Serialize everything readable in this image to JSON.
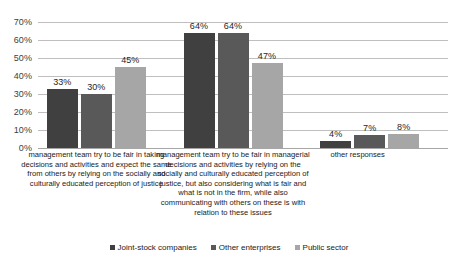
{
  "chart_data": {
    "type": "bar",
    "title": "",
    "xlabel": "",
    "ylabel": "",
    "ylim": [
      0,
      70
    ],
    "grid": true,
    "legend_position": "bottom",
    "categories": [
      "management team try to be fair in taking decisions and activities and expect the same from others by relying on the socially and culturally educated perception of justice",
      "management team try to be fair in managerial decisions and activities by relying on the socially and culturally educated perception of justice, but also considering what is fair and what is not in the firm, while also communicating with others on these is with relation to these issues",
      "other responses"
    ],
    "series": [
      {
        "name": "Joint-stock companies",
        "color": "#404040",
        "values": [
          33,
          64,
          4
        ]
      },
      {
        "name": "Other enterprises",
        "color": "#595959",
        "values": [
          30,
          64,
          7
        ]
      },
      {
        "name": "Public sector",
        "color": "#a6a6a6",
        "values": [
          45,
          47,
          8
        ]
      }
    ],
    "y_ticks": [
      "0%",
      "10%",
      "20%",
      "30%",
      "40%",
      "50%",
      "60%",
      "70%"
    ],
    "data_labels": [
      [
        "33%",
        "30%",
        "45%"
      ],
      [
        "64%",
        "64%",
        "47%"
      ],
      [
        "4%",
        "7%",
        "8%"
      ]
    ]
  }
}
